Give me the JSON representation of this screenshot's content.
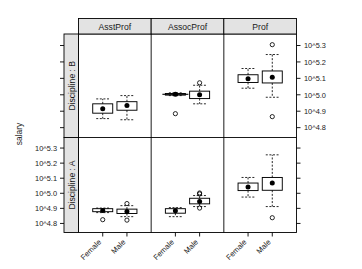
{
  "figure": {
    "y_axis_label": "salary",
    "background": "#ffffff",
    "line_color": "#000000",
    "strip_fill": "#e3e3e3"
  },
  "chart_data": {
    "type": "box",
    "title": "",
    "xlabel": "",
    "ylabel": "salary",
    "grid": false,
    "legend": "none",
    "axis_tick_labels": [
      "10^5.3",
      "10^5.2",
      "10^5.1",
      "10^5.0",
      "10^4.9",
      "10^4.8"
    ],
    "axis_tick_values": [
      5.3,
      5.2,
      5.1,
      5.0,
      4.9,
      4.8
    ],
    "ylim": [
      4.74,
      5.37
    ],
    "column_facets": [
      "AsstProf",
      "AssocProf",
      "Prof"
    ],
    "row_facets": [
      "Discipline : B",
      "Discipline : A"
    ],
    "x_categories": [
      "Female",
      "Male"
    ],
    "right_axis_labels_row": "Discipline : B",
    "left_axis_labels_row": "Discipline : A",
    "boxes": [
      {
        "row": "Discipline : B",
        "col": "AsstProf",
        "x": "Female",
        "lower_whisker": 4.855,
        "q1": 4.888,
        "median": 4.915,
        "q3": 4.945,
        "upper_whisker": 4.975,
        "outliers": []
      },
      {
        "row": "Discipline : B",
        "col": "AsstProf",
        "x": "Male",
        "lower_whisker": 4.848,
        "q1": 4.906,
        "median": 4.935,
        "q3": 4.958,
        "upper_whisker": 4.995,
        "outliers": []
      },
      {
        "row": "Discipline : B",
        "col": "AssocProf",
        "x": "Female",
        "lower_whisker": 4.995,
        "q1": 4.998,
        "median": 5.003,
        "q3": 5.008,
        "upper_whisker": 5.012,
        "outliers": [
          4.885
        ]
      },
      {
        "row": "Discipline : B",
        "col": "AssocProf",
        "x": "Male",
        "lower_whisker": 4.945,
        "q1": 4.977,
        "median": 5.0,
        "q3": 5.022,
        "upper_whisker": 5.058,
        "outliers": [
          5.073
        ]
      },
      {
        "row": "Discipline : B",
        "col": "Prof",
        "x": "Female",
        "lower_whisker": 5.04,
        "q1": 5.075,
        "median": 5.098,
        "q3": 5.122,
        "upper_whisker": 5.16,
        "outliers": []
      },
      {
        "row": "Discipline : B",
        "col": "Prof",
        "x": "Male",
        "lower_whisker": 4.985,
        "q1": 5.072,
        "median": 5.107,
        "q3": 5.145,
        "upper_whisker": 5.245,
        "outliers": [
          5.305,
          4.867
        ]
      },
      {
        "row": "Discipline : A",
        "col": "AsstProf",
        "x": "Female",
        "lower_whisker": 4.872,
        "q1": 4.878,
        "median": 4.886,
        "q3": 4.898,
        "upper_whisker": 4.902,
        "outliers": [
          4.825
        ]
      },
      {
        "row": "Discipline : A",
        "col": "AsstProf",
        "x": "Male",
        "lower_whisker": 4.845,
        "q1": 4.866,
        "median": 4.88,
        "q3": 4.895,
        "upper_whisker": 4.918,
        "outliers": [
          4.932,
          4.822
        ]
      },
      {
        "row": "Discipline : A",
        "col": "AssocProf",
        "x": "Female",
        "lower_whisker": 4.845,
        "q1": 4.868,
        "median": 4.884,
        "q3": 4.898,
        "upper_whisker": 4.905,
        "outliers": []
      },
      {
        "row": "Discipline : A",
        "col": "AssocProf",
        "x": "Male",
        "lower_whisker": 4.912,
        "q1": 4.93,
        "median": 4.945,
        "q3": 4.967,
        "upper_whisker": 4.985,
        "outliers": [
          5.002,
          4.996,
          4.902
        ]
      },
      {
        "row": "Discipline : A",
        "col": "Prof",
        "x": "Female",
        "lower_whisker": 4.975,
        "q1": 5.018,
        "median": 5.042,
        "q3": 5.068,
        "upper_whisker": 5.105,
        "outliers": []
      },
      {
        "row": "Discipline : A",
        "col": "Prof",
        "x": "Male",
        "lower_whisker": 4.912,
        "q1": 5.02,
        "median": 5.068,
        "q3": 5.105,
        "upper_whisker": 5.255,
        "outliers": [
          4.838
        ]
      }
    ]
  }
}
